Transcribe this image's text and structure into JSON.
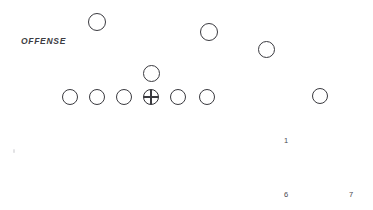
{
  "diagram": {
    "title_label": "OFFENSE",
    "title_position": {
      "x": 21,
      "y": 36
    },
    "canvas": {
      "width": 373,
      "height": 210
    },
    "line_color": "#3a3a3f",
    "background_color": "#ffffff"
  },
  "players": [
    {
      "name": "left-wide-receiver",
      "role": "receiver",
      "marker": "circle",
      "x": 88,
      "y": 13,
      "size": 18
    },
    {
      "name": "right-slot-receiver",
      "role": "receiver",
      "marker": "circle",
      "x": 200,
      "y": 23,
      "size": 18
    },
    {
      "name": "right-wide-receiver",
      "role": "receiver",
      "marker": "circle",
      "x": 258,
      "y": 41,
      "size": 17
    },
    {
      "name": "quarterback",
      "role": "backfield",
      "marker": "circle",
      "x": 143,
      "y": 65,
      "size": 17
    },
    {
      "name": "left-tackle",
      "role": "line",
      "marker": "circle",
      "x": 62,
      "y": 89,
      "size": 16
    },
    {
      "name": "left-guard",
      "role": "line",
      "marker": "circle",
      "x": 89,
      "y": 89,
      "size": 16
    },
    {
      "name": "left-inside-lineman",
      "role": "line",
      "marker": "circle",
      "x": 116,
      "y": 89,
      "size": 16
    },
    {
      "name": "center-ball",
      "role": "center",
      "marker": "circle-cross",
      "x": 143,
      "y": 89,
      "size": 16
    },
    {
      "name": "right-guard",
      "role": "line",
      "marker": "circle",
      "x": 170,
      "y": 89,
      "size": 16
    },
    {
      "name": "right-tackle",
      "role": "line",
      "marker": "circle",
      "x": 199,
      "y": 89,
      "size": 16
    },
    {
      "name": "far-right-end",
      "role": "line",
      "marker": "circle",
      "x": 312,
      "y": 88,
      "size": 16
    }
  ],
  "route_numbers": [
    {
      "name": "route-number-1",
      "label": "1",
      "x": 284,
      "y": 136
    },
    {
      "name": "route-number-6",
      "label": "6",
      "x": 284,
      "y": 190
    },
    {
      "name": "route-number-7",
      "label": "7",
      "x": 349,
      "y": 190
    }
  ],
  "artifacts": [
    {
      "name": "scan-speck",
      "x": 13,
      "y": 149
    }
  ]
}
